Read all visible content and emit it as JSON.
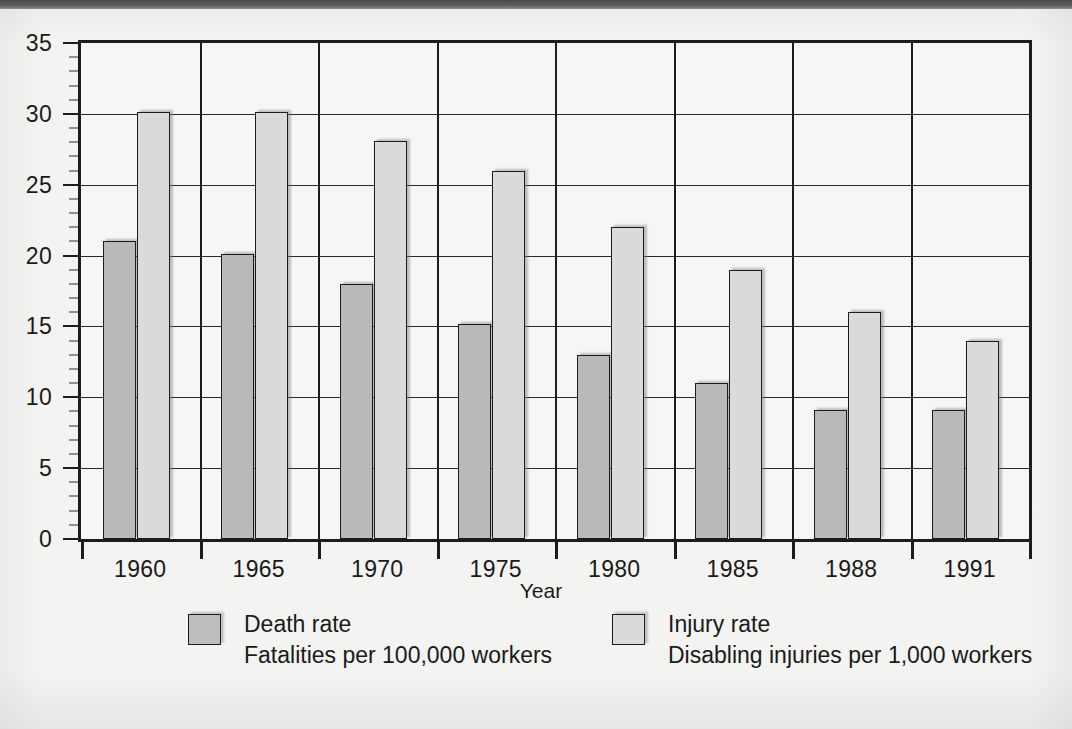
{
  "chart_data": {
    "type": "bar",
    "title": "",
    "subtitle": "",
    "xlabel": "Year",
    "ylabel": "",
    "categories": [
      "1960",
      "1965",
      "1970",
      "1975",
      "1980",
      "1985",
      "1988",
      "1991"
    ],
    "series": [
      {
        "name": "Death rate",
        "description": "Fatalities per 100,000 workers",
        "color": "#b9b9b9",
        "values": [
          21,
          20.1,
          18,
          15.2,
          13,
          11,
          9.1,
          9.1
        ]
      },
      {
        "name": "Injury rate",
        "description": "Disabling injuries per 1,000 workers",
        "color": "#dadad8",
        "values": [
          30.1,
          30.1,
          28.1,
          26,
          22,
          19,
          16,
          14
        ]
      }
    ],
    "ylim": [
      0,
      35
    ],
    "yticks": [
      0,
      5,
      10,
      15,
      20,
      25,
      30,
      35
    ],
    "ytick_labels": [
      "0",
      "5",
      "10",
      "15",
      "20",
      "25",
      "30",
      "35"
    ],
    "y_minor_tick_step": 1,
    "grid": "horizontal-gridlines-at-major-yticks-and-vertical-group-separators",
    "legend_position": "below-plot"
  },
  "axes": {
    "x_title": "Year",
    "y_title": ""
  },
  "legend": {
    "items": [
      {
        "swatch": "death-rate-swatch",
        "label": "Death rate",
        "sublabel": "Fatalities per 100,000 workers"
      },
      {
        "swatch": "injury-rate-swatch",
        "label": "Injury rate",
        "sublabel": "Disabling injuries per 1,000 workers"
      }
    ]
  },
  "colors": {
    "death_bar": "#b9b9b9",
    "injury_bar": "#dadad8",
    "axis": "#1c1c1c",
    "page_background": "#f3f3f1",
    "top_strip": "#4a4a4a"
  }
}
